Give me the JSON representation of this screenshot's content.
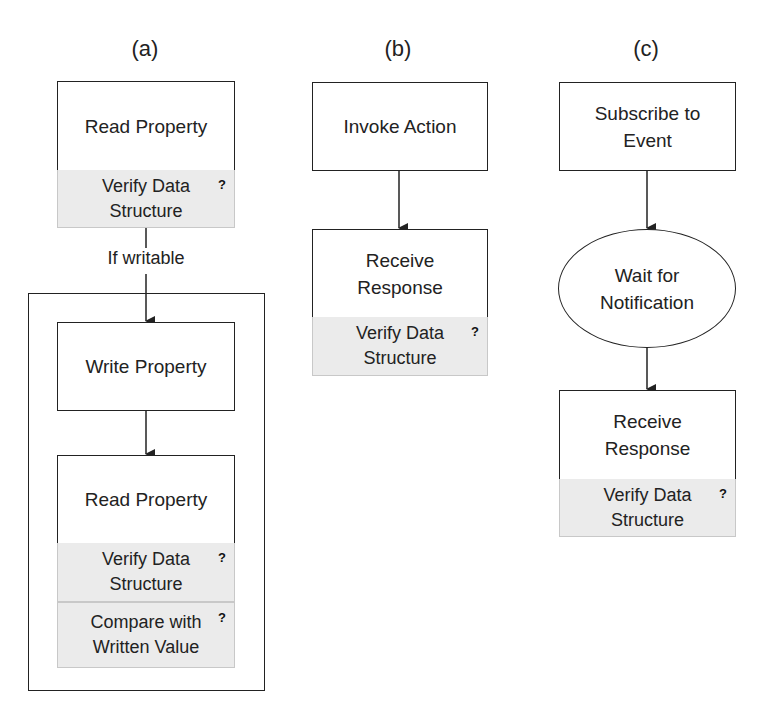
{
  "panels": {
    "a": {
      "label": "(a)",
      "read_property_1": "Read Property",
      "verify_1": "Verify Data\nStructure",
      "condition": "If writable",
      "write_property": "Write Property",
      "read_property_2": "Read Property",
      "verify_2": "Verify Data\nStructure",
      "compare": "Compare with\nWritten Value"
    },
    "b": {
      "label": "(b)",
      "invoke_action": "Invoke Action",
      "receive_response": "Receive\nResponse",
      "verify": "Verify Data\nStructure"
    },
    "c": {
      "label": "(c)",
      "subscribe": "Subscribe to\nEvent",
      "wait": "Wait for\nNotification",
      "receive_response": "Receive\nResponse",
      "verify": "Verify Data\nStructure"
    }
  },
  "check_marker": "?",
  "colors": {
    "stroke": "#222222",
    "band_fill": "#ebebeb",
    "background": "#ffffff"
  }
}
